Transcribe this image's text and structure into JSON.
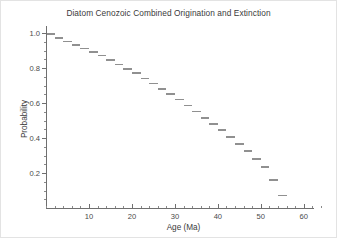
{
  "chart_data": {
    "type": "line",
    "title": "Diatom Cenozoic Combined Origination and Extinction",
    "xlabel": "Age (Ma)",
    "ylabel": "Probability",
    "xlim": [
      0,
      64
    ],
    "ylim": [
      0,
      1.04
    ],
    "grid": false,
    "legend": null,
    "marker_style": "horizontal-dash",
    "series_color": "#909090",
    "axis_color": "#6f6f6f",
    "xticks": [
      10,
      20,
      30,
      40,
      50,
      60
    ],
    "xtick_labels": [
      "10",
      "20",
      "30",
      "40",
      "50",
      "60"
    ],
    "xminor_step": 2,
    "yticks": [
      0.2,
      0.4,
      0.6,
      0.8,
      1.0
    ],
    "ytick_labels": [
      "0.2",
      "0.4",
      "0.6",
      "0.8",
      "1.0"
    ],
    "yminor_step": 0.05,
    "x": [
      1.2,
      3.0,
      5.0,
      7.0,
      9.0,
      11.0,
      13.0,
      15.0,
      17.0,
      19.0,
      21.0,
      23.0,
      25.0,
      27.0,
      29.0,
      31.0,
      33.0,
      35.0,
      37.0,
      39.0,
      41.0,
      43.0,
      45.0,
      47.0,
      49.0,
      51.0,
      53.0,
      55.0
    ],
    "values": [
      1.0,
      0.975,
      0.955,
      0.935,
      0.915,
      0.895,
      0.875,
      0.85,
      0.825,
      0.8,
      0.775,
      0.745,
      0.715,
      0.685,
      0.655,
      0.625,
      0.59,
      0.555,
      0.52,
      0.485,
      0.45,
      0.41,
      0.37,
      0.33,
      0.285,
      0.24,
      0.165,
      0.075
    ],
    "dash_width_ma": 2.0
  },
  "figure": {
    "background": "#ffffff",
    "border_color": "#e3e3e3"
  }
}
